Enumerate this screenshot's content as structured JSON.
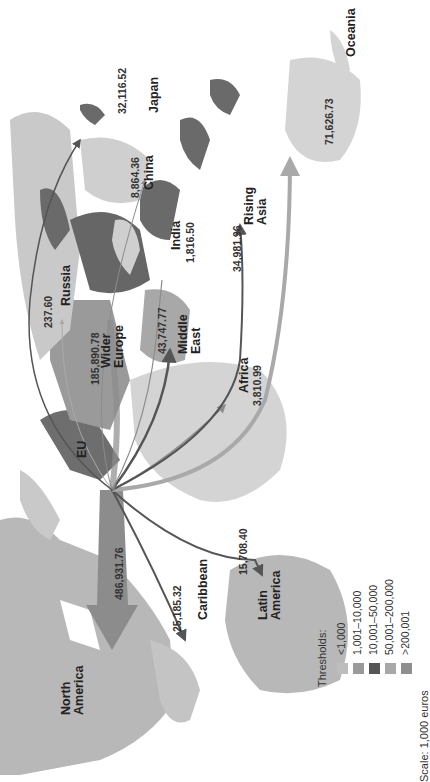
{
  "map": {
    "orientation": "rotated 90 degrees counter-clockwise",
    "origin_label": "EU",
    "regions": [
      {
        "name": "North America",
        "lines": [
          "North",
          "America"
        ],
        "value": "486,931.76"
      },
      {
        "name": "Caribbean",
        "lines": [
          "Caribbean"
        ],
        "value": "25,185.32"
      },
      {
        "name": "Latin America",
        "lines": [
          "Latin",
          "America"
        ],
        "value": "15,708.40"
      },
      {
        "name": "Africa",
        "lines": [
          "Africa"
        ],
        "value": "3,810.99"
      },
      {
        "name": "Middle East",
        "lines": [
          "Middle",
          "East"
        ],
        "value": "43,747.77"
      },
      {
        "name": "Wider Europe",
        "lines": [
          "Wider",
          "Europe"
        ],
        "value": "185,890.78"
      },
      {
        "name": "Russia",
        "lines": [
          "Russia"
        ],
        "value": "237.60"
      },
      {
        "name": "India",
        "lines": [
          "India"
        ],
        "value": "1,816.50"
      },
      {
        "name": "China",
        "lines": [
          "China"
        ],
        "value": "8,864.36"
      },
      {
        "name": "Japan",
        "lines": [
          "Japan"
        ],
        "value": "32,116.52"
      },
      {
        "name": "Rising Asia",
        "lines": [
          "Rising",
          "Asia"
        ],
        "value": "34,981.96"
      },
      {
        "name": "Oceania",
        "lines": [
          "Oceania"
        ],
        "value": "71,626.73"
      }
    ]
  },
  "legend": {
    "title": "Thresholds:",
    "items": [
      {
        "label": "<1,000",
        "color": "#bdbdbd"
      },
      {
        "label": "1,001–10,000",
        "color": "#9a9a9a"
      },
      {
        "label": "10,001–50,000",
        "color": "#555555"
      },
      {
        "label": "50,001–200,000",
        "color": "#a8a8a8"
      },
      {
        "label": ">200,001",
        "color": "#8e8e8e"
      }
    ],
    "scale": "Scale: 1,000 euros"
  },
  "colors": {
    "land_light": "#d4d4d4",
    "land_mid": "#b8b8b8",
    "land_dark": "#6a6a6a",
    "arrow_dark": "#555555",
    "arrow_mid": "#8c8c8c",
    "arrow_light": "#a9a9a9"
  }
}
